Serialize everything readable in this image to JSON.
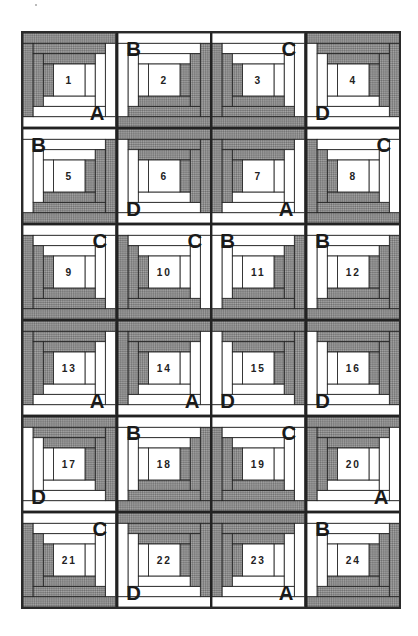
{
  "diagram": {
    "type": "log-cabin-quilt-layout",
    "rows": 6,
    "columns": 4,
    "colors": {
      "dark": "#8a8a8a",
      "dark_alt": "#6e6e6e",
      "light": "#ffffff",
      "line": "#222222"
    },
    "orientation_legend": {
      "A": "dark top-left, light bottom-right",
      "B": "light top-left, dark bottom-right",
      "C": "light top-right, dark bottom-left",
      "D": "light bottom-left, dark top-right"
    },
    "blocks": [
      {
        "number": "1",
        "label": "A"
      },
      {
        "number": "2",
        "label": "B"
      },
      {
        "number": "3",
        "label": "C"
      },
      {
        "number": "4",
        "label": "D"
      },
      {
        "number": "5",
        "label": "B"
      },
      {
        "number": "6",
        "label": "D"
      },
      {
        "number": "7",
        "label": "A"
      },
      {
        "number": "8",
        "label": "C"
      },
      {
        "number": "9",
        "label": "C"
      },
      {
        "number": "10",
        "label": "C"
      },
      {
        "number": "11",
        "label": "B"
      },
      {
        "number": "12",
        "label": "B"
      },
      {
        "number": "13",
        "label": "A"
      },
      {
        "number": "14",
        "label": "A"
      },
      {
        "number": "15",
        "label": "D"
      },
      {
        "number": "16",
        "label": "D"
      },
      {
        "number": "17",
        "label": "D"
      },
      {
        "number": "18",
        "label": "B"
      },
      {
        "number": "19",
        "label": "C"
      },
      {
        "number": "20",
        "label": "A"
      },
      {
        "number": "21",
        "label": "C"
      },
      {
        "number": "22",
        "label": "D"
      },
      {
        "number": "23",
        "label": "A"
      },
      {
        "number": "24",
        "label": "B"
      }
    ]
  }
}
